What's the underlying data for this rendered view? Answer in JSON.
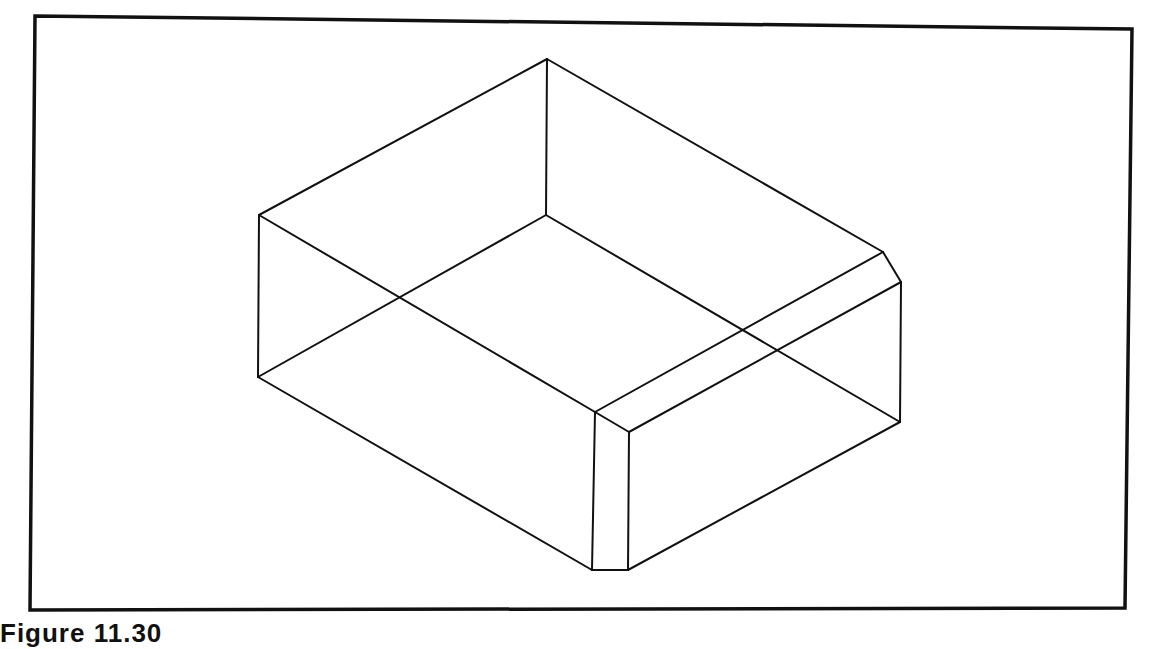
{
  "figure": {
    "caption": "Figure 11.30",
    "stroke_color": "#111111",
    "frame_color": "#111111",
    "background": "#ffffff"
  },
  "frame": {
    "points": [
      [
        35,
        16
      ],
      [
        1132,
        29
      ],
      [
        1125,
        608
      ],
      [
        30,
        610
      ]
    ]
  },
  "box": {
    "vertices": {
      "top_back": [
        547,
        59
      ],
      "top_left": [
        259,
        215
      ],
      "top_front_left": [
        595,
        412
      ],
      "top_front_right": [
        629,
        432
      ],
      "top_chamfer_a": [
        883,
        252
      ],
      "top_chamfer_b": [
        901,
        282
      ],
      "inner_corner": [
        546,
        215
      ],
      "bottom_left": [
        258,
        377
      ],
      "bottom_front_left": [
        592,
        570
      ],
      "bottom_front_right": [
        628,
        570
      ],
      "bottom_right": [
        900,
        422
      ]
    },
    "edges": [
      [
        "top_left",
        "top_back"
      ],
      [
        "top_back",
        "top_chamfer_a"
      ],
      [
        "top_chamfer_a",
        "top_chamfer_b"
      ],
      [
        "top_left",
        "top_front_left"
      ],
      [
        "top_front_left",
        "top_front_right"
      ],
      [
        "top_front_right",
        "top_chamfer_b"
      ],
      [
        "top_front_left",
        "top_chamfer_a"
      ],
      [
        "top_back",
        "inner_corner"
      ],
      [
        "inner_corner",
        "bottom_left"
      ],
      [
        "inner_corner",
        "bottom_right"
      ],
      [
        "top_left",
        "bottom_left"
      ],
      [
        "top_front_left",
        "bottom_front_left"
      ],
      [
        "top_front_right",
        "bottom_front_right"
      ],
      [
        "top_chamfer_b",
        "bottom_right"
      ],
      [
        "bottom_left",
        "bottom_front_left"
      ],
      [
        "bottom_front_left",
        "bottom_front_right"
      ],
      [
        "bottom_front_right",
        "bottom_right"
      ]
    ]
  }
}
